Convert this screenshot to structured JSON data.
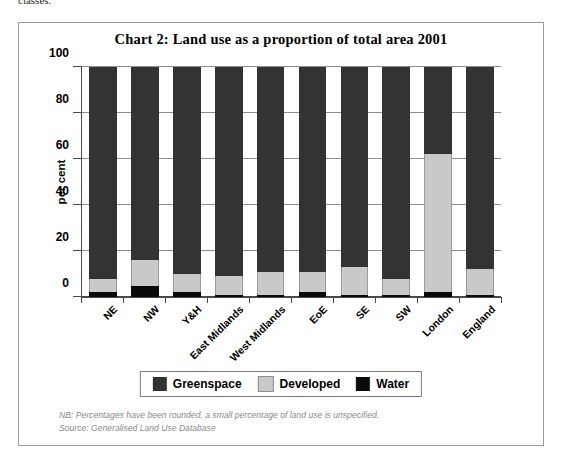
{
  "page": {
    "stub_text": "classes."
  },
  "figure": {
    "title": "Chart 2: Land use as a proportion of total area 2001",
    "y_axis_title": "per cent",
    "footnote_line1": "NB: Percentages have been rounded, a small percentage of land use is unspecified.",
    "footnote_line2": "Source: Generalised Land Use Database"
  },
  "colors": {
    "greenspace": "#333333",
    "developed": "#c9c9c9",
    "water": "#0a0a0a",
    "axis": "#4a4a4a",
    "gridline": "#8d8d8d",
    "frame": "#9b9b9b",
    "footnote_text": "#8a8a8a"
  },
  "legend": {
    "position": "bottom",
    "items": [
      {
        "label": "Greenspace",
        "color": "#333333"
      },
      {
        "label": "Developed",
        "color": "#c9c9c9"
      },
      {
        "label": "Water",
        "color": "#0a0a0a"
      }
    ]
  },
  "chart_data": {
    "type": "bar",
    "stacked": true,
    "title": "Chart 2: Land use as a proportion of total area 2001",
    "xlabel": "",
    "ylabel": "per cent",
    "ylim": [
      0,
      100
    ],
    "yticks": [
      0,
      20,
      40,
      60,
      80,
      100
    ],
    "ytick_labels": [
      "0",
      "20",
      "40",
      "60",
      "80",
      "100"
    ],
    "grid": true,
    "legend_position": "bottom",
    "categories": [
      "NE",
      "NW",
      "Y&H",
      "East Midlands",
      "West Midlands",
      "EoE",
      "SE",
      "SW",
      "London",
      "England"
    ],
    "series": [
      {
        "name": "Water",
        "color": "#0a0a0a",
        "values": [
          2,
          5,
          2,
          1,
          1,
          2,
          1,
          1,
          2,
          1
        ]
      },
      {
        "name": "Developed",
        "color": "#c9c9c9",
        "values": [
          6,
          11,
          8,
          8,
          10,
          9,
          12,
          7,
          60,
          11
        ]
      },
      {
        "name": "Greenspace",
        "color": "#333333",
        "values": [
          92,
          84,
          90,
          91,
          89,
          89,
          87,
          92,
          38,
          88
        ]
      }
    ]
  }
}
